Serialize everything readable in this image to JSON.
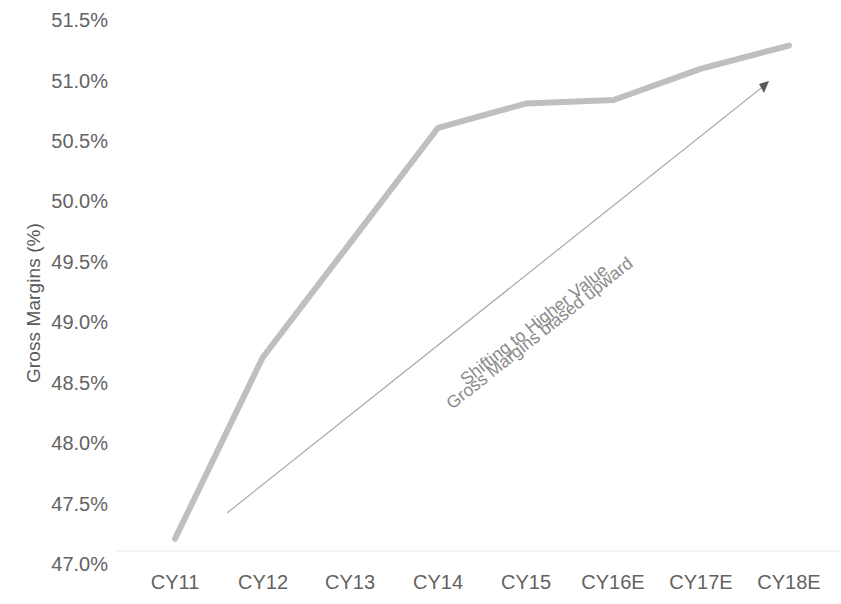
{
  "chart_data": {
    "type": "line",
    "title": "",
    "xlabel": "",
    "ylabel": "Gross Margins (%)",
    "categories": [
      "CY11",
      "CY12",
      "CY13",
      "CY14",
      "CY15",
      "CY16E",
      "CY17E",
      "CY18E"
    ],
    "series": [
      {
        "name": "Gross Margins",
        "values": [
          47.2,
          48.7,
          49.65,
          50.6,
          50.8,
          50.83,
          51.09,
          51.28
        ],
        "color": "#bfbfbf"
      }
    ],
    "ylim": [
      47.0,
      51.5
    ],
    "ytick_labels": [
      "51.5%",
      "51.0%",
      "50.5%",
      "50.0%",
      "49.5%",
      "49.0%",
      "48.5%",
      "48.0%",
      "47.5%",
      "47.0%"
    ],
    "ytick_values": [
      51.5,
      51.0,
      50.5,
      50.0,
      49.5,
      49.0,
      48.5,
      48.0,
      47.5,
      47.0
    ],
    "grid": false,
    "legend": "none",
    "annotations": [
      {
        "name": "trend-arrow-annotation",
        "line1": "Shifting to Higher Value",
        "line2": "Gross Margins biased upward",
        "color": "#8a8a8a",
        "arrow": true
      }
    ]
  },
  "axis": {
    "y_title": "Gross Margins (%)"
  },
  "colors": {
    "line": "#bfbfbf",
    "arrow": "#a6a6a6",
    "text": "#636363",
    "axis": "#d9d9d9"
  }
}
